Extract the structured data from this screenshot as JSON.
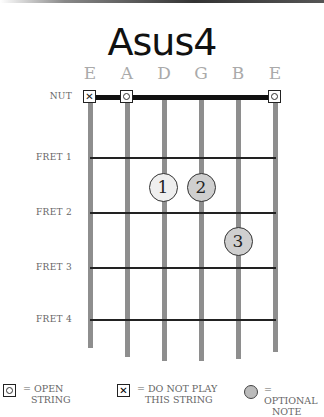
{
  "title": "Asus4",
  "strings": [
    {
      "name": "E",
      "x": 90,
      "bottom": 348,
      "marker": "x"
    },
    {
      "name": "A",
      "x": 127,
      "bottom": 357,
      "marker": "o"
    },
    {
      "name": "D",
      "x": 164,
      "bottom": 361,
      "marker": null
    },
    {
      "name": "G",
      "x": 201,
      "bottom": 361,
      "marker": null
    },
    {
      "name": "B",
      "x": 238,
      "bottom": 359,
      "marker": null
    },
    {
      "name": "E",
      "x": 275,
      "bottom": 352,
      "marker": "o"
    }
  ],
  "rows": [
    {
      "label": "NUT",
      "y": 97
    },
    {
      "label": "FRET 1",
      "y": 158
    },
    {
      "label": "FRET 2",
      "y": 213
    },
    {
      "label": "FRET 3",
      "y": 268
    },
    {
      "label": "FRET 4",
      "y": 320
    }
  ],
  "fingers": [
    {
      "number": "1",
      "string": "D",
      "x": 163,
      "y": 187,
      "color": "#efefef"
    },
    {
      "number": "2",
      "string": "G",
      "x": 201,
      "y": 187,
      "color": "#cfcfcf"
    },
    {
      "number": "3",
      "string": "B",
      "x": 238,
      "y": 241,
      "color": "#cfcfcf"
    }
  ],
  "legend": {
    "open": {
      "line1": "= OPEN",
      "line2": "STRING"
    },
    "mute": {
      "line1": "= DO NOT PLAY",
      "line2": "THIS STRING"
    },
    "optional": {
      "line1": "= OPTIONAL",
      "line2": "NOTE"
    }
  }
}
